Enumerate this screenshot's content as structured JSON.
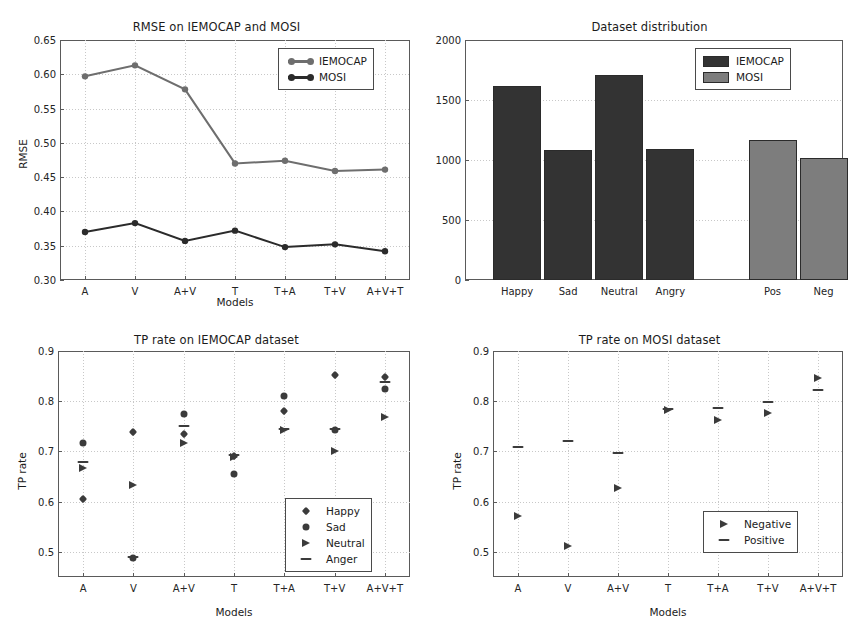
{
  "figure": {
    "background": "#ffffff",
    "panels": [
      "rmse",
      "distribution",
      "tp_iemocap",
      "tp_mosi"
    ]
  },
  "chart_data": [
    {
      "id": "rmse",
      "type": "line",
      "title": "RMSE on IEMOCAP and MOSI",
      "xlabel": "Models",
      "ylabel": "RMSE",
      "categories": [
        "A",
        "V",
        "A+V",
        "T",
        "T+A",
        "T+V",
        "A+V+T"
      ],
      "ylim": [
        0.3,
        0.65
      ],
      "yticks": [
        "0.30",
        "0.35",
        "0.40",
        "0.45",
        "0.50",
        "0.55",
        "0.60",
        "0.65"
      ],
      "ytick_values": [
        0.3,
        0.35,
        0.4,
        0.45,
        0.5,
        0.55,
        0.6,
        0.65
      ],
      "grid": true,
      "legend_position": "upper right",
      "series": [
        {
          "name": "IEMOCAP",
          "color": "#6e6e6e",
          "marker": "circle",
          "values": [
            0.597,
            0.613,
            0.578,
            0.47,
            0.474,
            0.459,
            0.461
          ]
        },
        {
          "name": "MOSI",
          "color": "#2b2b2b",
          "marker": "circle",
          "values": [
            0.37,
            0.383,
            0.357,
            0.372,
            0.348,
            0.352,
            0.342
          ]
        }
      ]
    },
    {
      "id": "distribution",
      "type": "bar",
      "title": "Dataset distribution",
      "xlabel": "",
      "ylabel": "",
      "categories": [
        "Happy",
        "Sad",
        "Neutral",
        "Angry",
        "Pos",
        "Neg"
      ],
      "values": [
        1620,
        1080,
        1710,
        1090,
        1165,
        1015
      ],
      "group_of": [
        "IEMOCAP",
        "IEMOCAP",
        "IEMOCAP",
        "IEMOCAP",
        "MOSI",
        "MOSI"
      ],
      "ylim": [
        0,
        2000
      ],
      "yticks": [
        "0",
        "500",
        "1000",
        "1500",
        "2000"
      ],
      "ytick_values": [
        0,
        500,
        1000,
        1500,
        2000
      ],
      "grid": true,
      "legend_position": "upper right",
      "legend": [
        {
          "name": "IEMOCAP",
          "color": "#333333"
        },
        {
          "name": "MOSI",
          "color": "#7d7d7d"
        }
      ]
    },
    {
      "id": "tp_iemocap",
      "type": "scatter",
      "title": "TP rate on IEMOCAP dataset",
      "xlabel": "Models",
      "ylabel": "TP rate",
      "categories": [
        "A",
        "V",
        "A+V",
        "T",
        "T+A",
        "T+V",
        "A+V+T"
      ],
      "ylim": [
        0.45,
        0.9
      ],
      "yticks": [
        "0.5",
        "0.6",
        "0.7",
        "0.8",
        "0.9"
      ],
      "ytick_values": [
        0.5,
        0.6,
        0.7,
        0.8,
        0.9
      ],
      "grid": true,
      "legend_position": "lower right",
      "series": [
        {
          "name": "Happy",
          "marker": "diamond",
          "color": "#3b3b3b",
          "values": [
            0.605,
            0.739,
            0.734,
            0.69,
            0.781,
            0.852,
            0.849
          ]
        },
        {
          "name": "Sad",
          "marker": "circle",
          "color": "#3b3b3b",
          "values": [
            0.717,
            0.487,
            0.774,
            0.656,
            0.81,
            0.743,
            0.824
          ]
        },
        {
          "name": "Neutral",
          "marker": "triangle",
          "color": "#3b3b3b",
          "values": [
            0.668,
            0.633,
            0.716,
            0.688,
            0.742,
            0.7,
            0.768
          ]
        },
        {
          "name": "Anger",
          "marker": "dash",
          "color": "#3b3b3b",
          "values": [
            0.678,
            0.49,
            0.75,
            0.692,
            0.744,
            0.745,
            0.838
          ]
        }
      ]
    },
    {
      "id": "tp_mosi",
      "type": "scatter",
      "title": "TP rate on MOSI dataset",
      "xlabel": "Models",
      "ylabel": "TP rate",
      "categories": [
        "A",
        "V",
        "A+V",
        "T",
        "T+A",
        "T+V",
        "A+V+T"
      ],
      "ylim": [
        0.45,
        0.9
      ],
      "yticks": [
        "0.5",
        "0.6",
        "0.7",
        "0.8",
        "0.9"
      ],
      "ytick_values": [
        0.5,
        0.6,
        0.7,
        0.8,
        0.9
      ],
      "grid": true,
      "legend_position": "lower right",
      "series": [
        {
          "name": "Negative",
          "marker": "triangle",
          "color": "#3b3b3b",
          "values": [
            0.572,
            0.511,
            0.628,
            0.782,
            0.763,
            0.776,
            0.846
          ]
        },
        {
          "name": "Positive",
          "marker": "dash",
          "color": "#3b3b3b",
          "values": [
            0.708,
            0.721,
            0.697,
            0.785,
            0.787,
            0.799,
            0.823
          ]
        }
      ]
    }
  ]
}
